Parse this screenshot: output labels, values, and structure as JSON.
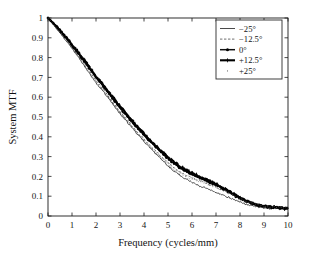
{
  "chart_data": {
    "type": "line",
    "title": "",
    "xlabel": "Frequency (cycles/mm)",
    "ylabel": "System MTF",
    "xlim": [
      0,
      10
    ],
    "ylim": [
      0,
      1
    ],
    "xticks": [
      "0",
      "1",
      "2",
      "3",
      "4",
      "5",
      "6",
      "7",
      "8",
      "9",
      "10"
    ],
    "yticks": [
      "0",
      "0.1",
      "0.2",
      "0.3",
      "0.4",
      "0.5",
      "0.6",
      "0.7",
      "0.8",
      "0.9",
      "1"
    ],
    "grid": false,
    "legend_position": "top-right",
    "x": [
      0,
      0.25,
      0.5,
      0.75,
      1,
      1.25,
      1.5,
      1.75,
      2,
      2.25,
      2.5,
      2.75,
      3,
      3.25,
      3.5,
      3.75,
      4,
      4.25,
      4.5,
      4.75,
      5,
      5.25,
      5.5,
      5.75,
      6,
      6.25,
      6.5,
      6.75,
      7,
      7.25,
      7.5,
      7.75,
      8,
      8.25,
      8.5,
      8.75,
      9,
      9.25,
      9.5,
      9.75,
      10
    ],
    "series": [
      {
        "name": "−25°",
        "style": "solid",
        "marker": "none",
        "color": "#2b2b2b",
        "values": [
          1.0,
          0.963,
          0.925,
          0.886,
          0.846,
          0.805,
          0.762,
          0.718,
          0.672,
          0.636,
          0.598,
          0.558,
          0.518,
          0.482,
          0.446,
          0.411,
          0.377,
          0.345,
          0.313,
          0.283,
          0.254,
          0.228,
          0.205,
          0.186,
          0.169,
          0.156,
          0.145,
          0.133,
          0.121,
          0.108,
          0.095,
          0.082,
          0.069,
          0.059,
          0.051,
          0.046,
          0.042,
          0.039,
          0.037,
          0.035,
          0.034
        ]
      },
      {
        "name": "−12.5°",
        "style": "dashed",
        "marker": "none",
        "color": "#4a4a4a",
        "values": [
          1.0,
          0.966,
          0.93,
          0.892,
          0.852,
          0.812,
          0.77,
          0.727,
          0.683,
          0.645,
          0.606,
          0.566,
          0.527,
          0.491,
          0.455,
          0.42,
          0.387,
          0.356,
          0.325,
          0.296,
          0.268,
          0.243,
          0.222,
          0.205,
          0.192,
          0.181,
          0.17,
          0.158,
          0.146,
          0.132,
          0.117,
          0.101,
          0.085,
          0.072,
          0.062,
          0.055,
          0.05,
          0.046,
          0.043,
          0.041,
          0.04
        ]
      },
      {
        "name": "0°",
        "style": "solid-marker",
        "marker": "circle",
        "color": "#111111",
        "values": [
          1.0,
          0.969,
          0.936,
          0.9,
          0.862,
          0.823,
          0.783,
          0.741,
          0.699,
          0.662,
          0.624,
          0.585,
          0.546,
          0.51,
          0.474,
          0.44,
          0.407,
          0.376,
          0.346,
          0.317,
          0.29,
          0.265,
          0.243,
          0.224,
          0.208,
          0.195,
          0.183,
          0.17,
          0.156,
          0.14,
          0.124,
          0.106,
          0.089,
          0.075,
          0.063,
          0.055,
          0.049,
          0.045,
          0.042,
          0.039,
          0.037
        ]
      },
      {
        "name": "+12.5°",
        "style": "solid-marker",
        "marker": "star",
        "color": "#000000",
        "values": [
          1.0,
          0.97,
          0.938,
          0.903,
          0.866,
          0.828,
          0.789,
          0.748,
          0.706,
          0.669,
          0.631,
          0.592,
          0.554,
          0.518,
          0.482,
          0.448,
          0.415,
          0.384,
          0.354,
          0.325,
          0.298,
          0.272,
          0.25,
          0.231,
          0.215,
          0.201,
          0.189,
          0.176,
          0.161,
          0.145,
          0.128,
          0.11,
          0.092,
          0.077,
          0.065,
          0.056,
          0.05,
          0.046,
          0.043,
          0.04,
          0.038
        ]
      },
      {
        "name": "+25°",
        "style": "dotted",
        "marker": "none",
        "color": "#6a6a6a",
        "values": [
          1.0,
          0.964,
          0.927,
          0.888,
          0.848,
          0.807,
          0.765,
          0.721,
          0.676,
          0.639,
          0.601,
          0.561,
          0.522,
          0.486,
          0.45,
          0.415,
          0.381,
          0.35,
          0.319,
          0.29,
          0.262,
          0.237,
          0.216,
          0.199,
          0.186,
          0.176,
          0.166,
          0.155,
          0.143,
          0.13,
          0.116,
          0.101,
          0.086,
          0.073,
          0.063,
          0.056,
          0.051,
          0.047,
          0.044,
          0.042,
          0.041
        ]
      }
    ]
  },
  "legend": {
    "entries": [
      {
        "label": "−25°"
      },
      {
        "label": "−12.5°"
      },
      {
        "label": "0°"
      },
      {
        "label": "+12.5°"
      },
      {
        "label": "+25°"
      }
    ]
  }
}
